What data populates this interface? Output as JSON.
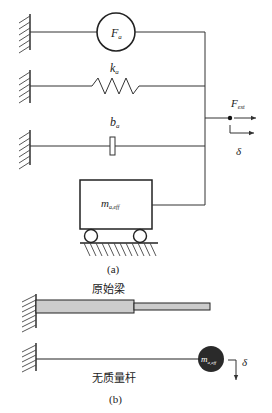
{
  "figure_a": {
    "caption": "(a)",
    "force_source": {
      "symbol": "F",
      "subscript": "a"
    },
    "spring": {
      "symbol": "k",
      "subscript": "a"
    },
    "damper": {
      "symbol": "b",
      "subscript": "a"
    },
    "mass": {
      "symbol": "m",
      "subscript": "a,eff"
    },
    "output_force": {
      "symbol": "F",
      "subscript": "ext"
    },
    "displacement": {
      "symbol": "δ"
    }
  },
  "figure_b": {
    "caption": "(b)",
    "original_beam_label": "原始梁",
    "massless_rod_label": "无质量杆",
    "tip_mass": {
      "symbol": "m",
      "subscript": "a,eff"
    },
    "displacement": {
      "symbol": "δ"
    }
  },
  "colors": {
    "line": "#333333",
    "beam_fill": "#cccccc",
    "tip_mass_fill": "#2a2a2a",
    "background": "#ffffff"
  }
}
